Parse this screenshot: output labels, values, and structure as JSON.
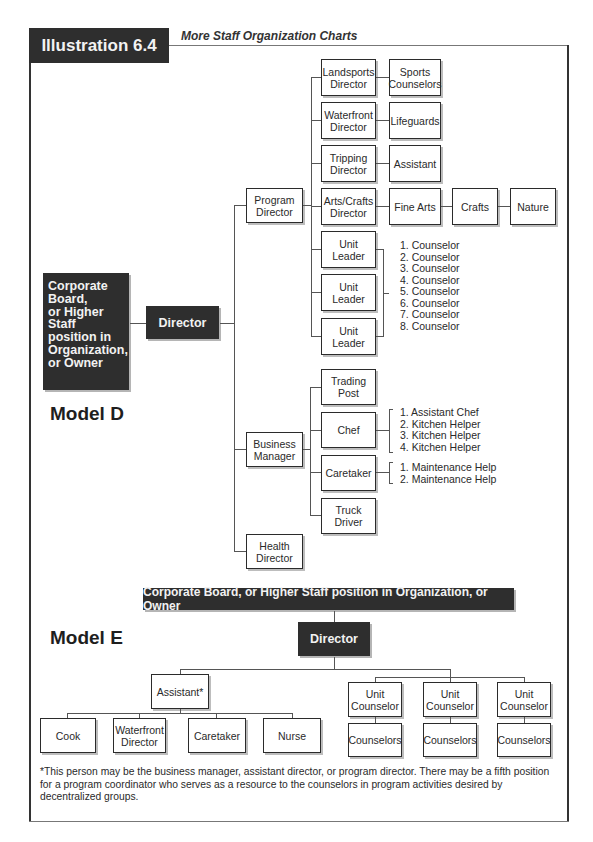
{
  "header": {
    "illustration_label": "Illustration 6.4",
    "subtitle": "More Staff Organization Charts"
  },
  "model_d": {
    "label": "Model D",
    "top": "Corporate Board, or Higher Staff position in Organization, or Owner",
    "top_lines": [
      "Corporate",
      "Board,",
      "or Higher",
      "Staff",
      "position in",
      "Organization,",
      "or Owner"
    ],
    "director": "Director",
    "program_director": "Program Director",
    "program_children": [
      {
        "label": "Landsports Director",
        "child": "Sports Counselors"
      },
      {
        "label": "Waterfront Director",
        "child": "Lifeguards"
      },
      {
        "label": "Tripping Director",
        "child": "Assistant"
      },
      {
        "label": "Arts/Crafts Director",
        "chain": [
          "Fine Arts",
          "Crafts",
          "Nature"
        ]
      },
      {
        "label": "Unit Leader"
      },
      {
        "label": "Unit Leader"
      },
      {
        "label": "Unit Leader"
      }
    ],
    "unit_leader_counselors": [
      "1. Counselor",
      "2. Counselor",
      "3. Counselor",
      "4. Counselor",
      "5. Counselor",
      "6. Counselor",
      "7. Counselor",
      "8. Counselor"
    ],
    "business_manager": "Business Manager",
    "business_children": [
      {
        "label": "Trading Post"
      },
      {
        "label": "Chef",
        "staff": [
          "1. Assistant Chef",
          "2. Kitchen Helper",
          "3. Kitchen Helper",
          "4. Kitchen Helper"
        ]
      },
      {
        "label": "Caretaker",
        "staff": [
          "1. Maintenance Help",
          "2. Maintenance Help"
        ]
      },
      {
        "label": "Truck Driver"
      }
    ],
    "health_director": "Health Director"
  },
  "model_e": {
    "label": "Model E",
    "top": "Corporate Board, or Higher Staff position in Organization, or Owner",
    "director": "Director",
    "assistant": "Assistant*",
    "assistant_children": [
      "Cook",
      "Waterfront Director",
      "Caretaker",
      "Nurse"
    ],
    "unit_counselors": [
      {
        "label": "Unit Counselor",
        "child": "Counselors"
      },
      {
        "label": "Unit Counselor",
        "child": "Counselors"
      },
      {
        "label": "Unit Counselor",
        "child": "Counselors"
      }
    ]
  },
  "footnote": "*This person may be the business manager, assistant director, or program director. There may be a fifth position for a program coordinator who serves as a resource to the counselors in program activities desired by decentralized groups."
}
